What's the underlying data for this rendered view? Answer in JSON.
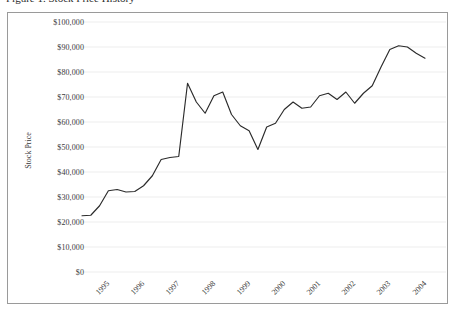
{
  "figure": {
    "caption_clipped": "Figure 1. Stock Price History"
  },
  "chart_data": {
    "type": "line",
    "title": "",
    "xlabel": "",
    "ylabel": "Stock Price",
    "ylim": [
      0,
      100000
    ],
    "ytick_values": [
      100000,
      90000,
      80000,
      70000,
      60000,
      50000,
      40000,
      30000,
      20000,
      10000,
      0
    ],
    "ytick_labels": [
      "$100,000",
      "$90,000",
      "$80,000",
      "$70,000",
      "$60,000",
      "$50,000",
      "$40,000",
      "$30,000",
      "$20,000",
      "$10,000",
      "$0"
    ],
    "xtick_labels": [
      "1995",
      "1996",
      "1997",
      "1998",
      "1999",
      "2000",
      "2001",
      "2002",
      "2003",
      "2004"
    ],
    "xlim": [
      1995.0,
      2004.75
    ],
    "grid": true,
    "legend": "none",
    "line_color": "#2b2b2b",
    "series": [
      {
        "name": "Stock Price",
        "x": [
          1995.0,
          1995.25,
          1995.5,
          1995.75,
          1996.0,
          1996.25,
          1996.5,
          1996.75,
          1997.0,
          1997.25,
          1997.5,
          1997.75,
          1998.0,
          1998.25,
          1998.5,
          1998.75,
          1999.0,
          1999.25,
          1999.5,
          1999.75,
          2000.0,
          2000.25,
          2000.5,
          2000.75,
          2001.0,
          2001.25,
          2001.5,
          2001.75,
          2002.0,
          2002.25,
          2002.5,
          2002.75,
          2003.0,
          2003.25,
          2003.5,
          2003.75,
          2004.0,
          2004.25,
          2004.5,
          2004.75
        ],
        "values": [
          22500,
          22700,
          26500,
          32500,
          33000,
          32000,
          32200,
          34500,
          38500,
          45000,
          45800,
          46200,
          75500,
          68000,
          63500,
          70500,
          72000,
          63000,
          58500,
          56500,
          49000,
          58000,
          59500,
          65000,
          68000,
          65500,
          66000,
          70500,
          71500,
          69000,
          72000,
          67500,
          71500,
          74500,
          82000,
          89000,
          90500,
          90000,
          87500,
          85500
        ]
      }
    ]
  }
}
